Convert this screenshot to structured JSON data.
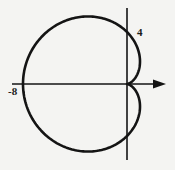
{
  "figure": {
    "type": "polar-curve",
    "equation": "r = 4 - 4cos(theta)",
    "labels": {
      "left_intercept": "-8",
      "top_intercept": "4"
    },
    "colors": {
      "curve": "#141414",
      "axes": "#141414",
      "background": "#f4f4f2"
    }
  },
  "chart_data": {
    "type": "line",
    "title": "",
    "curve": "cardioid r = 4 - 4cos(theta)",
    "xlabel": "",
    "ylabel": "",
    "tick_labels": [
      "-8",
      "4"
    ],
    "key_points": [
      {
        "x": -8,
        "y": 0,
        "label": "-8"
      },
      {
        "x": 0,
        "y": 4,
        "label": "4"
      },
      {
        "x": 0,
        "y": -4,
        "label": ""
      },
      {
        "x": 0,
        "y": 0,
        "label": "cusp"
      }
    ],
    "xlim": [
      -9,
      3.5
    ],
    "ylim": [
      -5.9,
      6.2
    ],
    "grid": false,
    "legend": "none"
  }
}
